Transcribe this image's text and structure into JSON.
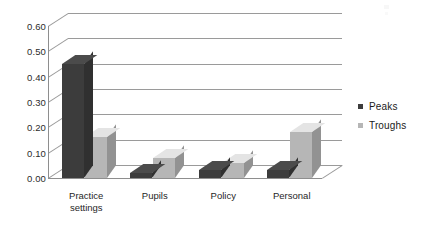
{
  "chart_data": {
    "type": "bar",
    "title": "",
    "subtitle": "",
    "xlabel": "",
    "ylabel": "",
    "categories": [
      "Practice settings",
      "Pupils",
      "Policy",
      "Personal"
    ],
    "series": [
      {
        "name": "Peaks",
        "values": [
          0.45,
          0.02,
          0.03,
          0.03
        ],
        "color": "#3c3c3c"
      },
      {
        "name": "Troughs",
        "values": [
          0.16,
          0.08,
          0.06,
          0.18
        ],
        "color": "#b6b6b6"
      }
    ],
    "ylim": [
      0.0,
      0.6
    ],
    "ytick_labels": [
      "0.60",
      "0.50",
      "0.40",
      "0.30",
      "0.20",
      "0.10",
      "0.00"
    ],
    "ytick_values": [
      0.6,
      0.5,
      0.4,
      0.3,
      0.2,
      0.1,
      0.0
    ],
    "grid": true,
    "grid_axis": "y",
    "legend_position": "right",
    "three_d": true,
    "style": "grayscale-scanned"
  },
  "legend": {
    "items": [
      {
        "label": "Peaks",
        "color": "#3c3c3c",
        "marker": "square-swatch-icon"
      },
      {
        "label": "Troughs",
        "color": "#b6b6b6",
        "marker": "square-swatch-icon"
      }
    ]
  },
  "colors": {
    "peaks": "#3c3c3c",
    "troughs": "#b6b6b6",
    "gridline": "#9a9a9a",
    "axis": "#8e8e8e",
    "text": "#1f1f1f",
    "background": "#ffffff"
  }
}
